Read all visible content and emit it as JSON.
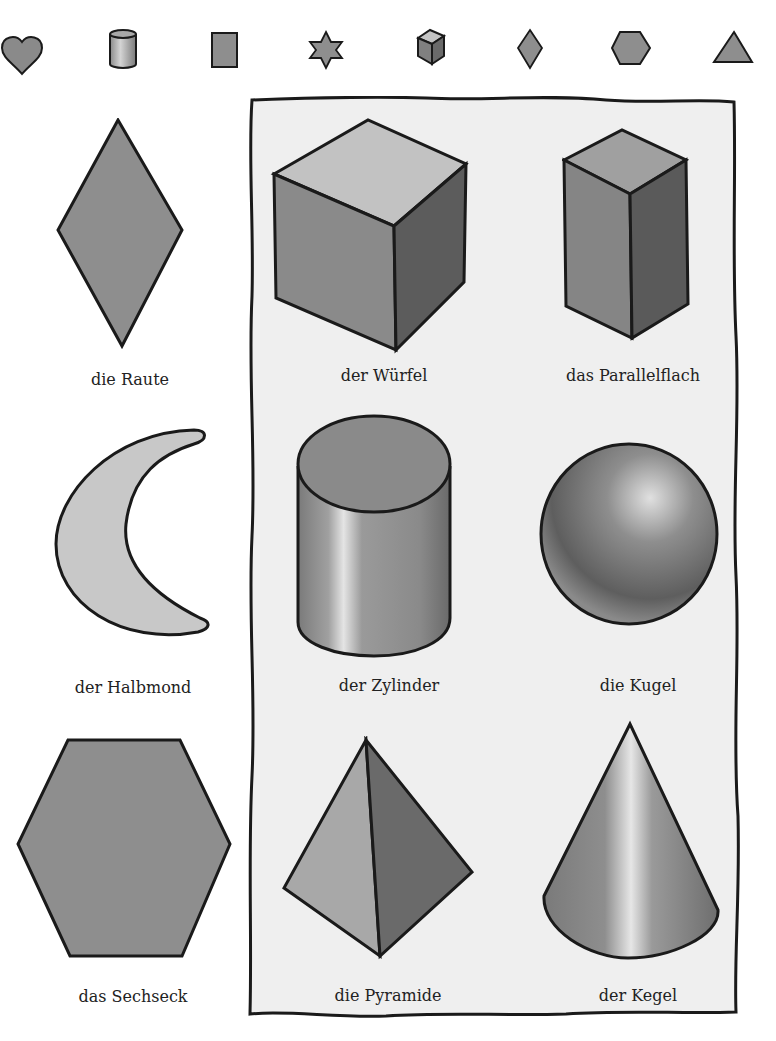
{
  "top_icons": [
    {
      "name": "heart",
      "x": 0
    },
    {
      "name": "cylinder",
      "x": 100
    },
    {
      "name": "rectangle",
      "x": 200
    },
    {
      "name": "star",
      "x": 300
    },
    {
      "name": "cube",
      "x": 407
    },
    {
      "name": "rhombus",
      "x": 505
    },
    {
      "name": "hexagon",
      "x": 605
    },
    {
      "name": "triangle",
      "x": 710
    }
  ],
  "shapes_2d": [
    {
      "label": "die Raute"
    },
    {
      "label": "der Halbmond"
    },
    {
      "label": "das Sechseck"
    }
  ],
  "shapes_3d": [
    {
      "label": "der Würfel"
    },
    {
      "label": "das Parallelflach"
    },
    {
      "label": "der Zylinder"
    },
    {
      "label": "die Kugel"
    },
    {
      "label": "die Pyramide"
    },
    {
      "label": "der Kegel"
    }
  ],
  "colors": {
    "fill_mid": "#8e8e8e",
    "fill_light": "#c8c8c8",
    "fill_dark": "#5e5e5e",
    "outline": "#1a1a1a",
    "panel_bg": "#efefef"
  }
}
